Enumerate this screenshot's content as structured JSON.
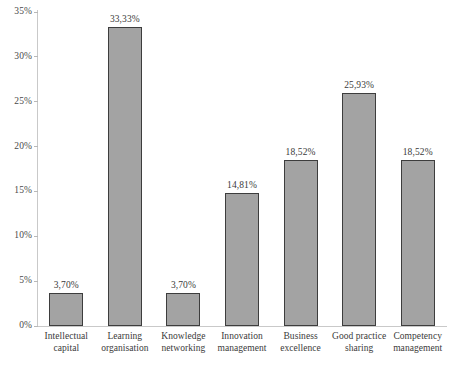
{
  "chart_data": {
    "type": "bar",
    "title": "",
    "subtitle": "",
    "xlabel": "",
    "ylabel": "",
    "categories": [
      "Intellectual capital",
      "Learning organisation",
      "Knowledge networking",
      "Innovation management",
      "Business excellence",
      "Good practice sharing",
      "Competency management"
    ],
    "values": [
      3.7,
      33.33,
      3.7,
      14.81,
      18.52,
      25.93,
      18.52
    ],
    "data_labels": [
      "3,70%",
      "33,33%",
      "3,70%",
      "14,81%",
      "18,52%",
      "25,93%",
      "18,52%"
    ],
    "ylim": [
      0,
      35
    ],
    "ytick_values": [
      0,
      5,
      10,
      15,
      20,
      25,
      30,
      35
    ],
    "ytick_labels": [
      "0%",
      "5%",
      "10%",
      "15%",
      "20%",
      "25%",
      "30%",
      "35%"
    ],
    "grid": false,
    "legend": false,
    "legend_position": "none",
    "bar_fill_color": "#a3a3a3",
    "bar_border_color": "#3d3d3d",
    "axis_color": "#c9c9c9",
    "text_color": "#3a3a3a"
  }
}
